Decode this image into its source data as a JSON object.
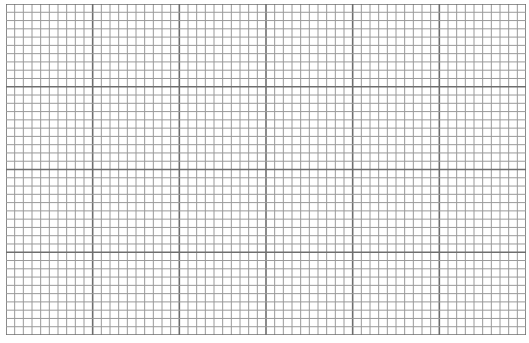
{
  "graph_paper": {
    "major_columns": 6,
    "major_rows": 4,
    "minor_per_major": 10,
    "minor_line_color": "#9a9a9a",
    "major_line_color": "#6e6e6e",
    "background": "#ffffff"
  }
}
